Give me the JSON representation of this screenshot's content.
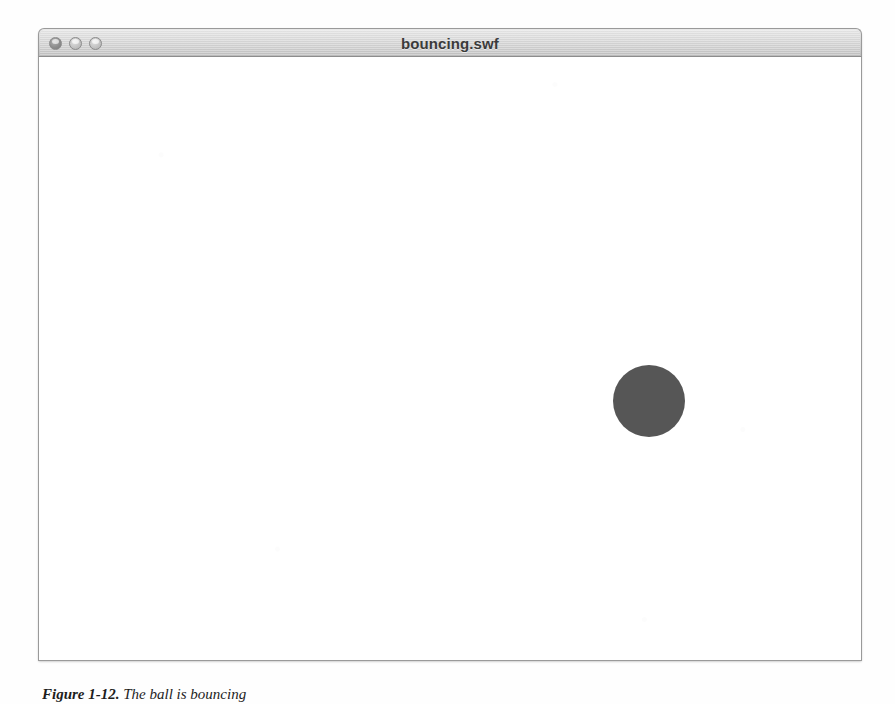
{
  "page": {
    "background_color": "#fefefe"
  },
  "window": {
    "title": "bouncing.swf",
    "titlebar_color": "#d4d4d4",
    "controls": [
      {
        "name": "close",
        "label": "Close",
        "color": "#8e8e8e"
      },
      {
        "name": "minimize",
        "label": "Minimize",
        "color": "#c4c4c4"
      },
      {
        "name": "zoom",
        "label": "Zoom",
        "color": "#c4c4c4"
      }
    ],
    "stage": {
      "background_color": "#ffffff",
      "ball": {
        "label": "ball",
        "color": "#565656",
        "left": 571,
        "top": 305,
        "diameter": 72
      }
    }
  },
  "caption": {
    "label": "Figure 1-12.",
    "text": " The ball is bouncing"
  }
}
